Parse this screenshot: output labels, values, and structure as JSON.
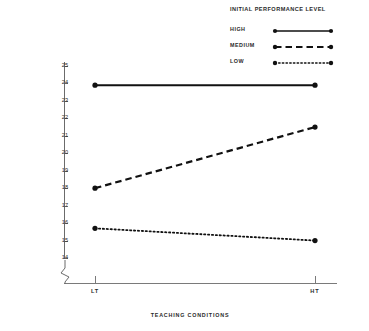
{
  "chart_data": {
    "type": "line",
    "title": "",
    "xlabel": "TEACHING CONDITIONS",
    "ylabel": "LPAD SET VARIATIONS : (SCORE",
    "categories": [
      "LT",
      "HT"
    ],
    "x": [
      0,
      1
    ],
    "ylim": [
      13.5,
      25.3
    ],
    "yticks": [
      25,
      24,
      23,
      22,
      21,
      20,
      19,
      18,
      17,
      16,
      15,
      14
    ],
    "ytick_labels": [
      "25",
      "24",
      "23",
      "22",
      "21",
      "20",
      "19",
      "18",
      "17",
      "16",
      "15",
      "14"
    ],
    "y_axis_break": true,
    "grid": false,
    "legend_position": "top-right",
    "legend_title": "INITIAL PERFORMANCE LEVEL",
    "series": [
      {
        "name": "HIGH",
        "style": "solid",
        "values": [
          23.9,
          23.9
        ]
      },
      {
        "name": "MEDIUM",
        "style": "dashed",
        "values": [
          18.0,
          21.5
        ]
      },
      {
        "name": "LOW",
        "style": "dotted",
        "values": [
          15.7,
          15.0
        ]
      }
    ],
    "colors": {
      "line": "#111111",
      "axis": "#6b6b6b",
      "text": "#2b2b2b"
    }
  },
  "legend": {
    "title": "INITIAL PERFORMANCE LEVEL",
    "entries": [
      {
        "label": "HIGH",
        "style": "solid"
      },
      {
        "label": "MEDIUM",
        "style": "dashed"
      },
      {
        "label": "LOW",
        "style": "dotted"
      }
    ]
  },
  "axes": {
    "y_title": "LPAD SET VARIATIONS : (SCORE",
    "x_title": "TEACHING CONDITIONS",
    "y_ticks": [
      "25",
      "24",
      "23",
      "22",
      "21",
      "20",
      "19",
      "18",
      "17",
      "16",
      "15",
      "14"
    ],
    "x_ticks": [
      "LT",
      "HT"
    ]
  }
}
